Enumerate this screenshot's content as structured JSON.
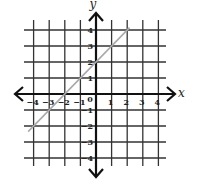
{
  "chart_data": {
    "type": "line",
    "title": "",
    "xlabel": "x",
    "ylabel": "y",
    "xlim": [
      -4,
      4
    ],
    "ylim": [
      -4,
      4
    ],
    "grid": true,
    "x_ticks": [
      "-4",
      "-3",
      "-2",
      "-1",
      "0",
      "1",
      "2",
      "3",
      "4"
    ],
    "y_ticks": [
      "4",
      "3",
      "2",
      "1",
      "-1",
      "-2",
      "-3",
      "-4"
    ],
    "series": [
      {
        "name": "y = x + 2",
        "equation": "y = x + 2",
        "x": [
          -4,
          -3,
          -2,
          -1,
          0,
          1,
          2
        ],
        "y": [
          -2,
          -1,
          0,
          1,
          2,
          3,
          4
        ],
        "color": "#aaaaaa"
      }
    ]
  },
  "labels": {
    "x_axis": "x",
    "y_axis": "y",
    "origin": "0",
    "x_ticks": [
      {
        "v": -4,
        "t": "−4"
      },
      {
        "v": -3,
        "t": "−3"
      },
      {
        "v": -2,
        "t": "−2"
      },
      {
        "v": -1,
        "t": "−1"
      },
      {
        "v": 1,
        "t": "1"
      },
      {
        "v": 2,
        "t": "2"
      },
      {
        "v": 3,
        "t": "3"
      },
      {
        "v": 4,
        "t": "4"
      }
    ],
    "y_ticks": [
      {
        "v": 4,
        "t": "4"
      },
      {
        "v": 3,
        "t": "3"
      },
      {
        "v": 2,
        "t": "2"
      },
      {
        "v": 1,
        "t": "1"
      },
      {
        "v": -1,
        "t": "−1"
      },
      {
        "v": -2,
        "t": "−2"
      },
      {
        "v": -3,
        "t": "−3"
      },
      {
        "v": -4,
        "t": "−4"
      }
    ]
  },
  "colors": {
    "grid": "#333333",
    "axis": "#111111",
    "line": "#aaaaaa"
  }
}
